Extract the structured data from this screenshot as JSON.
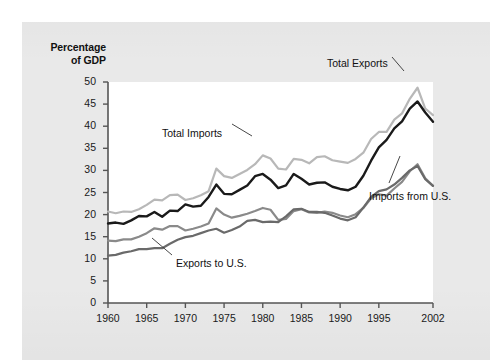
{
  "figure": {
    "background_color": "#e9e9e9",
    "plot_background_color": "#ffffff"
  },
  "chart_data": {
    "type": "line",
    "title": "",
    "subtitle": "",
    "xlabel": "",
    "ylabel": "Percentage of GDP",
    "ylabel_line1": "Percentage",
    "ylabel_line2": "of GDP",
    "xlim": [
      1960,
      2002
    ],
    "ylim": [
      0,
      50
    ],
    "ytick_labels": [
      "0",
      "5",
      "10",
      "15",
      "20",
      "25",
      "30",
      "35",
      "40",
      "45",
      "50"
    ],
    "yticks": [
      0,
      5,
      10,
      15,
      20,
      25,
      30,
      35,
      40,
      45,
      50
    ],
    "xtick_labels": [
      "1960",
      "1965",
      "1970",
      "1975",
      "1980",
      "1985",
      "1990",
      "1995",
      "2002"
    ],
    "xticks": [
      1960,
      1965,
      1970,
      1975,
      1980,
      1985,
      1990,
      1995,
      2002
    ],
    "grid": false,
    "legend_position": "inline-annotations",
    "x": [
      1960,
      1961,
      1962,
      1963,
      1964,
      1965,
      1966,
      1967,
      1968,
      1969,
      1970,
      1971,
      1972,
      1973,
      1974,
      1975,
      1976,
      1977,
      1978,
      1979,
      1980,
      1981,
      1982,
      1983,
      1984,
      1985,
      1986,
      1987,
      1988,
      1989,
      1990,
      1991,
      1992,
      1993,
      1994,
      1995,
      1996,
      1997,
      1998,
      1999,
      2000,
      2001,
      2002
    ],
    "series": [
      {
        "name": "Total Imports",
        "color": "#b8b8b8",
        "values": [
          20.7,
          20.3,
          20.7,
          20.6,
          21.2,
          22.2,
          23.4,
          23.2,
          24.4,
          24.5,
          23.3,
          23.7,
          24.4,
          25.3,
          30.4,
          28.7,
          28.3,
          29.2,
          30.1,
          31.4,
          33.4,
          32.7,
          30.4,
          30.2,
          32.6,
          32.4,
          31.6,
          33.0,
          33.2,
          32.3,
          32.0,
          31.7,
          32.6,
          34.0,
          37.1,
          38.7,
          38.7,
          41.5,
          42.9,
          46.2,
          48.7,
          44.0,
          42.5
        ]
      },
      {
        "name": "Total Exports",
        "color": "#1a1a1a",
        "values": [
          18.0,
          18.2,
          17.9,
          18.7,
          19.7,
          19.6,
          20.6,
          19.5,
          20.9,
          20.8,
          22.3,
          21.8,
          22.0,
          24.0,
          26.8,
          24.7,
          24.6,
          25.6,
          26.6,
          28.7,
          29.2,
          27.9,
          26.0,
          26.6,
          29.2,
          28.1,
          26.8,
          27.2,
          27.3,
          26.3,
          25.8,
          25.5,
          26.3,
          28.8,
          32.2,
          35.2,
          36.9,
          39.5,
          41.1,
          44.0,
          45.6,
          43.1,
          41.0
        ]
      },
      {
        "name": "Imports from U.S.",
        "color": "#8a8a8a",
        "values": [
          14.1,
          14.0,
          14.4,
          14.4,
          15.0,
          15.8,
          16.9,
          16.6,
          17.4,
          17.4,
          16.4,
          16.8,
          17.3,
          18.0,
          21.4,
          20.0,
          19.3,
          19.7,
          20.2,
          20.8,
          21.5,
          21.1,
          18.8,
          19.0,
          20.8,
          21.2,
          20.5,
          20.4,
          20.7,
          20.4,
          19.8,
          19.4,
          20.1,
          21.5,
          23.7,
          24.6,
          24.3,
          25.9,
          27.4,
          29.8,
          31.4,
          28.2,
          26.5
        ]
      },
      {
        "name": "Exports to U.S.",
        "color": "#6a6a6a",
        "values": [
          10.7,
          10.9,
          11.4,
          11.7,
          12.2,
          12.2,
          12.4,
          12.4,
          13.4,
          14.3,
          14.9,
          15.2,
          15.8,
          16.4,
          16.8,
          15.9,
          16.5,
          17.3,
          18.6,
          18.8,
          18.3,
          18.4,
          18.3,
          19.6,
          21.2,
          21.3,
          20.6,
          20.6,
          20.4,
          19.8,
          19.1,
          18.7,
          19.4,
          21.6,
          24.0,
          25.3,
          25.7,
          26.8,
          28.3,
          30.0,
          31.0,
          28.0,
          26.5
        ]
      }
    ],
    "annotations": [
      {
        "text": "Total Imports",
        "x_px": 162,
        "y_px": 127
      },
      {
        "text": "Total Exports",
        "x_px": 327,
        "y_px": 57
      },
      {
        "text": "Imports from U.S.",
        "x_px": 369,
        "y_px": 190
      },
      {
        "text": "Exports to U.S.",
        "x_px": 176,
        "y_px": 257
      }
    ]
  }
}
